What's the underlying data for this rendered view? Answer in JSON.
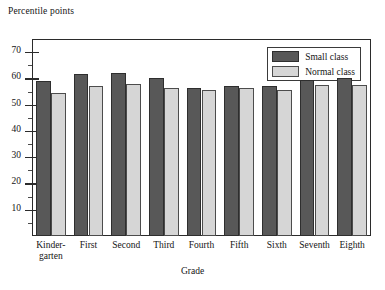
{
  "chart_data": {
    "type": "bar",
    "title": "",
    "ylabel": "Percentile points",
    "xlabel": "Grade",
    "ylim": [
      0,
      75
    ],
    "yticks": [
      10,
      20,
      30,
      40,
      50,
      60,
      70
    ],
    "ytick_labels": [
      "10",
      "20",
      "30",
      "40",
      "50",
      "60",
      "70"
    ],
    "grid": false,
    "legend_position": "top-right-inside",
    "categories": [
      "Kinder-garten",
      "First",
      "Second",
      "Third",
      "Fourth",
      "Fifth",
      "Sixth",
      "Seventh",
      "Eighth"
    ],
    "category_lines": [
      [
        "Kinder-",
        "garten"
      ],
      [
        "First",
        ""
      ],
      [
        "Second",
        ""
      ],
      [
        "Third",
        ""
      ],
      [
        "Fourth",
        ""
      ],
      [
        "Fifth",
        ""
      ],
      [
        "Sixth",
        ""
      ],
      [
        "Seventh",
        ""
      ],
      [
        "Eighth",
        ""
      ]
    ],
    "series": [
      {
        "name": "Small class",
        "color": "#585858",
        "values": [
          59,
          61.5,
          62,
          60,
          56.5,
          57,
          57,
          59.5,
          60
        ]
      },
      {
        "name": "Normal class",
        "color": "#d6d6d6",
        "values": [
          54.5,
          57,
          58,
          56.5,
          55.5,
          56.5,
          55.5,
          57.5,
          57.5
        ]
      }
    ]
  },
  "legend": {
    "items": [
      {
        "label": "Small class",
        "swatch": "small"
      },
      {
        "label": "Normal class",
        "swatch": "normal"
      }
    ]
  },
  "axes": {
    "y_title": "Percentile points",
    "x_title": "Grade"
  },
  "colors": {
    "small_class": "#585858",
    "normal_class": "#d6d6d6",
    "frame": "#2b2b2b",
    "background": "#ffffff"
  }
}
